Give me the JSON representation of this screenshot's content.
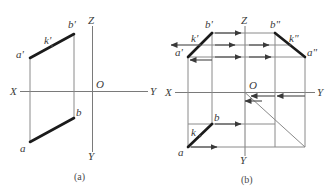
{
  "figure": {
    "title_caption_a": "(a)",
    "title_caption_b": "(b)"
  },
  "panel_a": {
    "name": "projection-diagram-a",
    "axis_labels": {
      "x": "X",
      "y_right": "Y",
      "z": "Z",
      "y_down": "Y",
      "origin": "O"
    },
    "point_labels": {
      "a_prime": "a'",
      "b_prime": "b'",
      "k_prime": "k'",
      "a": "a",
      "b": "b"
    }
  },
  "panel_b": {
    "name": "projection-diagram-b",
    "axis_labels": {
      "x": "X",
      "y_right": "Y",
      "z": "Z",
      "y_down": "Y",
      "origin": "O"
    },
    "point_labels": {
      "a_prime": "a'",
      "b_prime": "b'",
      "k_prime": "k'",
      "a_double_prime": "a\"",
      "b_double_prime": "b\"",
      "k_double_prime": "k\"",
      "a": "a",
      "b": "b",
      "k": "k"
    }
  },
  "colors": {
    "stroke_thick": "#1b1b1b",
    "stroke_thin": "#8a8a8a",
    "axis": "#7a7a7a",
    "text": "#3a3a3a",
    "background": "#ffffff"
  }
}
